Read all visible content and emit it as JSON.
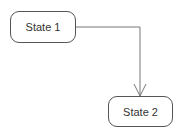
{
  "diagram": {
    "type": "state-diagram",
    "states": [
      {
        "id": "state-1",
        "label": "State 1"
      },
      {
        "id": "state-2",
        "label": "State 2"
      }
    ],
    "transitions": [
      {
        "from": "state-1",
        "to": "state-2",
        "label": "",
        "arrowhead": "open"
      }
    ],
    "colors": {
      "stroke": "#555555",
      "edge": "#777777",
      "text": "#333333",
      "background": "#ffffff"
    }
  }
}
